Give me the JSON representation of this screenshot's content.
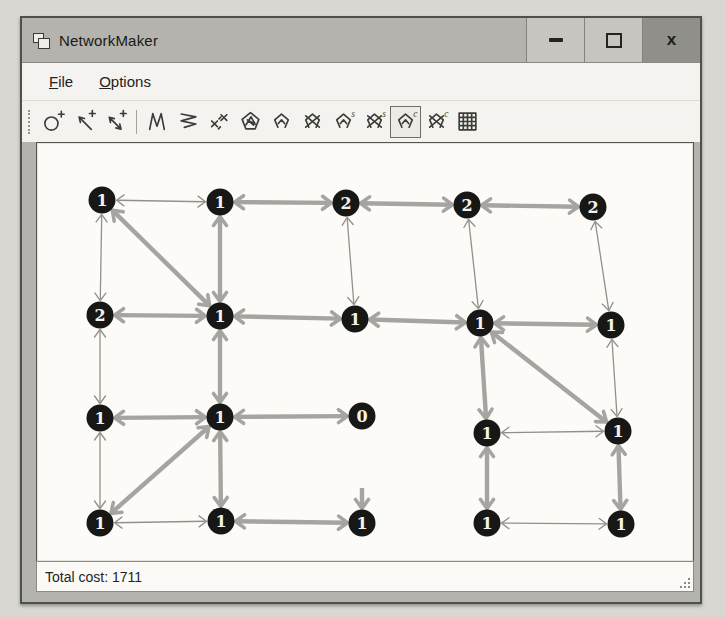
{
  "window": {
    "title": "NetworkMaker",
    "app_icon": "window-glyph",
    "controls": [
      {
        "name": "minimize",
        "glyph": "–"
      },
      {
        "name": "maximize",
        "glyph": "□"
      },
      {
        "name": "close",
        "glyph": "x"
      }
    ]
  },
  "menu": {
    "items": [
      {
        "label": "File",
        "underline_index": 0
      },
      {
        "label": "Options",
        "underline_index": 0
      }
    ]
  },
  "toolbar": {
    "buttons": [
      {
        "name": "make-node",
        "icon": "node-plus"
      },
      {
        "name": "make-directed-link",
        "icon": "arrow-plus"
      },
      {
        "name": "make-two-way-link",
        "icon": "arrow2-plus"
      },
      {
        "name": "separator",
        "icon": "separator"
      },
      {
        "name": "zigzag-network",
        "icon": "zigzag-v"
      },
      {
        "name": "zigzag-network-2",
        "icon": "zigzag-h"
      },
      {
        "name": "scatter-links",
        "icon": "cross-links"
      },
      {
        "name": "scribble-network",
        "icon": "net-scribble"
      },
      {
        "name": "small-network",
        "icon": "net"
      },
      {
        "name": "crossed-network",
        "icon": "net-crossed"
      },
      {
        "name": "network-s",
        "icon": "net",
        "badge": "s"
      },
      {
        "name": "crossed-network-s",
        "icon": "net-crossed",
        "badge": "s"
      },
      {
        "name": "network-c",
        "icon": "net",
        "badge": "c",
        "selected": true
      },
      {
        "name": "crossed-network-c",
        "icon": "net-crossed",
        "badge": "c"
      },
      {
        "name": "grid-network",
        "icon": "grid"
      }
    ]
  },
  "status": {
    "text": "Total cost: 1711"
  },
  "graph": {
    "colors": {
      "node_fill": "#171715",
      "node_text": "#f4f2ec",
      "edge_thick": "#a6a4a0",
      "edge_thin": "#91908c"
    },
    "node_radius": 13.5,
    "nodes": [
      {
        "id": "n0",
        "x": 65,
        "y": 57,
        "label": "1"
      },
      {
        "id": "n1",
        "x": 183,
        "y": 59,
        "label": "1"
      },
      {
        "id": "n2",
        "x": 309,
        "y": 60,
        "label": "2"
      },
      {
        "id": "n3",
        "x": 430,
        "y": 62,
        "label": "2"
      },
      {
        "id": "n4",
        "x": 556,
        "y": 64,
        "label": "2"
      },
      {
        "id": "n5",
        "x": 63,
        "y": 172,
        "label": "2"
      },
      {
        "id": "n6",
        "x": 183,
        "y": 173,
        "label": "1"
      },
      {
        "id": "n7",
        "x": 318,
        "y": 176,
        "label": "1"
      },
      {
        "id": "n8",
        "x": 443,
        "y": 180,
        "label": "1"
      },
      {
        "id": "n9",
        "x": 574,
        "y": 182,
        "label": "1"
      },
      {
        "id": "n10",
        "x": 63,
        "y": 275,
        "label": "1"
      },
      {
        "id": "n11",
        "x": 183,
        "y": 274,
        "label": "1"
      },
      {
        "id": "n12",
        "x": 325,
        "y": 273,
        "label": "0"
      },
      {
        "id": "n13",
        "x": 450,
        "y": 290,
        "label": "1"
      },
      {
        "id": "n14",
        "x": 581,
        "y": 288,
        "label": "1"
      },
      {
        "id": "n15",
        "x": 63,
        "y": 380,
        "label": "1"
      },
      {
        "id": "n16",
        "x": 184,
        "y": 378,
        "label": "1"
      },
      {
        "id": "n17",
        "x": 325,
        "y": 380,
        "label": "1"
      },
      {
        "id": "n18",
        "x": 450,
        "y": 380,
        "label": "1"
      },
      {
        "id": "n19",
        "x": 584,
        "y": 381,
        "label": "1"
      },
      {
        "id": "p17",
        "x": 325,
        "y": 345,
        "label": "",
        "hidden": true
      }
    ],
    "edges": [
      {
        "from": "n0",
        "to": "n1",
        "w": "thin"
      },
      {
        "from": "n1",
        "to": "n2",
        "w": "thick"
      },
      {
        "from": "n2",
        "to": "n3",
        "w": "thick"
      },
      {
        "from": "n3",
        "to": "n4",
        "w": "thick"
      },
      {
        "from": "n5",
        "to": "n6",
        "w": "thick"
      },
      {
        "from": "n6",
        "to": "n7",
        "w": "thick"
      },
      {
        "from": "n7",
        "to": "n8",
        "w": "thick"
      },
      {
        "from": "n8",
        "to": "n9",
        "w": "thick"
      },
      {
        "from": "n10",
        "to": "n11",
        "w": "thick"
      },
      {
        "from": "n11",
        "to": "n12",
        "w": "thick"
      },
      {
        "from": "n13",
        "to": "n14",
        "w": "thin"
      },
      {
        "from": "n15",
        "to": "n16",
        "w": "thin"
      },
      {
        "from": "n16",
        "to": "n17",
        "w": "thick"
      },
      {
        "from": "n18",
        "to": "n19",
        "w": "thin"
      },
      {
        "from": "n0",
        "to": "n5",
        "w": "thin"
      },
      {
        "from": "n5",
        "to": "n10",
        "w": "thin"
      },
      {
        "from": "n10",
        "to": "n15",
        "w": "thin"
      },
      {
        "from": "n1",
        "to": "n6",
        "w": "thick"
      },
      {
        "from": "n6",
        "to": "n11",
        "w": "thick"
      },
      {
        "from": "n11",
        "to": "n16",
        "w": "thick"
      },
      {
        "from": "n2",
        "to": "n7",
        "w": "thin"
      },
      {
        "from": "n3",
        "to": "n8",
        "w": "thin"
      },
      {
        "from": "n8",
        "to": "n13",
        "w": "thick"
      },
      {
        "from": "n13",
        "to": "n18",
        "w": "thick"
      },
      {
        "from": "n4",
        "to": "n9",
        "w": "thin"
      },
      {
        "from": "n9",
        "to": "n14",
        "w": "thin"
      },
      {
        "from": "n14",
        "to": "n19",
        "w": "thick"
      },
      {
        "from": "n0",
        "to": "n6",
        "w": "thick"
      },
      {
        "from": "n11",
        "to": "n15",
        "w": "thick"
      },
      {
        "from": "n8",
        "to": "n14",
        "w": "thick"
      },
      {
        "from": "p17",
        "to": "n17",
        "w": "thick",
        "no_tail": true
      }
    ]
  }
}
